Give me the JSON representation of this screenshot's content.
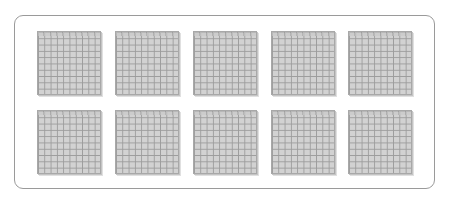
{
  "figure": {
    "rows": 2,
    "columns": 5,
    "grid_per_flat": "10x10",
    "flat_count": 10,
    "colors": {
      "frame_border": "#9a9a9a",
      "flat_fill": "#d2d2d2",
      "grid_line": "#9c9c9c"
    }
  },
  "flats": [
    {
      "row": 0,
      "col": 0,
      "x": 37,
      "y": 31
    },
    {
      "row": 0,
      "col": 1,
      "x": 115,
      "y": 31
    },
    {
      "row": 0,
      "col": 2,
      "x": 193,
      "y": 31
    },
    {
      "row": 0,
      "col": 3,
      "x": 271,
      "y": 31
    },
    {
      "row": 0,
      "col": 4,
      "x": 348,
      "y": 31
    },
    {
      "row": 1,
      "col": 0,
      "x": 37,
      "y": 110
    },
    {
      "row": 1,
      "col": 1,
      "x": 115,
      "y": 110
    },
    {
      "row": 1,
      "col": 2,
      "x": 193,
      "y": 110
    },
    {
      "row": 1,
      "col": 3,
      "x": 271,
      "y": 110
    },
    {
      "row": 1,
      "col": 4,
      "x": 348,
      "y": 110
    }
  ]
}
